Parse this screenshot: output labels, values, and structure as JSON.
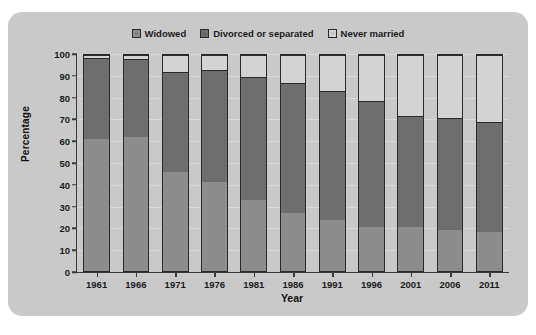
{
  "chart_data": {
    "type": "bar",
    "stacked": true,
    "title": "",
    "xlabel": "Year",
    "ylabel": "Percentage",
    "ylim": [
      0,
      100
    ],
    "ytick_step": 10,
    "yticks": [
      0,
      10,
      20,
      30,
      40,
      50,
      60,
      70,
      80,
      90,
      100
    ],
    "grid": true,
    "legend_position": "top-center",
    "categories": [
      "1961",
      "1966",
      "1971",
      "1976",
      "1981",
      "1986",
      "1991",
      "1996",
      "2001",
      "2006",
      "2011"
    ],
    "series": [
      {
        "name": "Widowed",
        "color": "#8d8d8d",
        "values": [
          61,
          62,
          46,
          41,
          33,
          27,
          23.5,
          20.5,
          20.5,
          19,
          18
        ]
      },
      {
        "name": "Divorced or separated",
        "color": "#6e6e6e",
        "values": [
          37.5,
          36,
          46,
          52,
          57,
          60,
          60,
          58,
          51.5,
          52,
          51
        ]
      },
      {
        "name": "Never married",
        "color": "#d3d3d3",
        "values": [
          1.5,
          2,
          8,
          7,
          10,
          13,
          16.5,
          21.5,
          28,
          29,
          31
        ]
      }
    ],
    "cumulative_tops": {
      "widowed": [
        61,
        62,
        46,
        41,
        33,
        27,
        23.5,
        20.5,
        20.5,
        19,
        18
      ],
      "divorced": [
        98.5,
        98,
        92,
        93,
        90,
        87,
        83.5,
        78.5,
        72,
        71,
        69
      ],
      "never": [
        100,
        100,
        100,
        100,
        100,
        100,
        100,
        100,
        100,
        100,
        100
      ]
    }
  },
  "legend": {
    "items": [
      {
        "label": "Widowed",
        "color": "#8d8d8d"
      },
      {
        "label": "Divorced or separated",
        "color": "#6e6e6e"
      },
      {
        "label": "Never married",
        "color": "#d3d3d3"
      }
    ]
  },
  "axes": {
    "y_title": "Percentage",
    "x_title": "Year"
  },
  "style": {
    "card_background": "#c9c9c9",
    "page_background": "#ffffff",
    "axis_color": "#3a3a3a",
    "text_color": "#1b1b1b"
  }
}
